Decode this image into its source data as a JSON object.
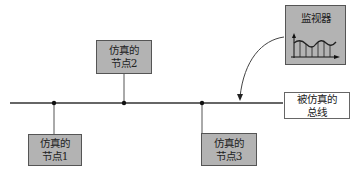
{
  "nodes": [
    {
      "id": "node1",
      "line1": "仿真的",
      "line2": "节点1"
    },
    {
      "id": "node2",
      "line1": "仿真的",
      "line2": "节点2"
    },
    {
      "id": "node3",
      "line1": "仿真的",
      "line2": "节点3"
    }
  ],
  "monitor": {
    "label": "监视器",
    "icon": "waveform-chart-icon"
  },
  "bus": {
    "line1": "被仿真的",
    "line2": "总线"
  },
  "colors": {
    "node_fill": "#b3b3b3",
    "monitor_fill": "#b3b3b3",
    "line": "#333333",
    "bus_box_fill": "#ffffff"
  }
}
